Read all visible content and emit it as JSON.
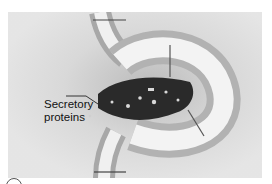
{
  "figure": {
    "labels": [
      {
        "id": "secretory-proteins",
        "line1": "Secretory",
        "line2": "proteins"
      }
    ],
    "colors": {
      "background": "#e4e4e4",
      "membrane_head": "#bdbdbd",
      "membrane_tail": "#f2f2f2",
      "vesicle_lumen": "#2a2a2a",
      "protein": "#d8d8d8",
      "text": "#111111"
    }
  }
}
